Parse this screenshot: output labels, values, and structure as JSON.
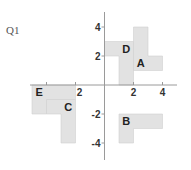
{
  "question": {
    "label": "Q1"
  },
  "grid": {
    "origin_px": [
      104.5,
      85
    ],
    "unit_px": 14.5,
    "x_axis_range_px": [
      30,
      177
    ],
    "y_axis_range_px": [
      12,
      160
    ]
  },
  "colors": {
    "shape_fill": "#e2e2e2",
    "axis": "#9a9a9a",
    "text": "#222222"
  },
  "x_ticks": [
    {
      "value": -4,
      "label": ""
    },
    {
      "value": -2,
      "label": "2"
    },
    {
      "value": 2,
      "label": "2"
    },
    {
      "value": 4,
      "label": "4"
    }
  ],
  "y_ticks": [
    {
      "value": 4,
      "label": "4"
    },
    {
      "value": 2,
      "label": "2"
    },
    {
      "value": -2,
      "label": "-2"
    },
    {
      "value": -4,
      "label": "-4"
    }
  ],
  "shapes": [
    {
      "name": "A",
      "points": [
        [
          2,
          1
        ],
        [
          4,
          1
        ],
        [
          4,
          2
        ],
        [
          3,
          2
        ],
        [
          3,
          4
        ],
        [
          2,
          4
        ]
      ],
      "label_pos": [
        2.5,
        1.5
      ]
    },
    {
      "name": "B",
      "points": [
        [
          1,
          -4
        ],
        [
          2,
          -4
        ],
        [
          2,
          -3
        ],
        [
          4,
          -3
        ],
        [
          4,
          -2
        ],
        [
          1,
          -2
        ]
      ],
      "label_pos": [
        1.5,
        -2.5
      ]
    },
    {
      "name": "C",
      "points": [
        [
          -4,
          -2
        ],
        [
          -3,
          -2
        ],
        [
          -3,
          -4
        ],
        [
          -2,
          -4
        ],
        [
          -2,
          -1
        ],
        [
          -4,
          -1
        ]
      ],
      "label_pos": [
        -2.5,
        -1.5
      ]
    },
    {
      "name": "D",
      "points": [
        [
          0,
          3
        ],
        [
          2,
          3
        ],
        [
          2,
          0
        ],
        [
          1,
          0
        ],
        [
          1,
          2
        ],
        [
          0,
          2
        ]
      ],
      "label_pos": [
        1.5,
        2.5
      ]
    },
    {
      "name": "E",
      "points": [
        [
          -5,
          0
        ],
        [
          -2,
          0
        ],
        [
          -2,
          -1
        ],
        [
          -4,
          -1
        ],
        [
          -4,
          -2
        ],
        [
          -5,
          -2
        ]
      ],
      "label_pos": [
        -4.5,
        -0.5
      ]
    }
  ]
}
